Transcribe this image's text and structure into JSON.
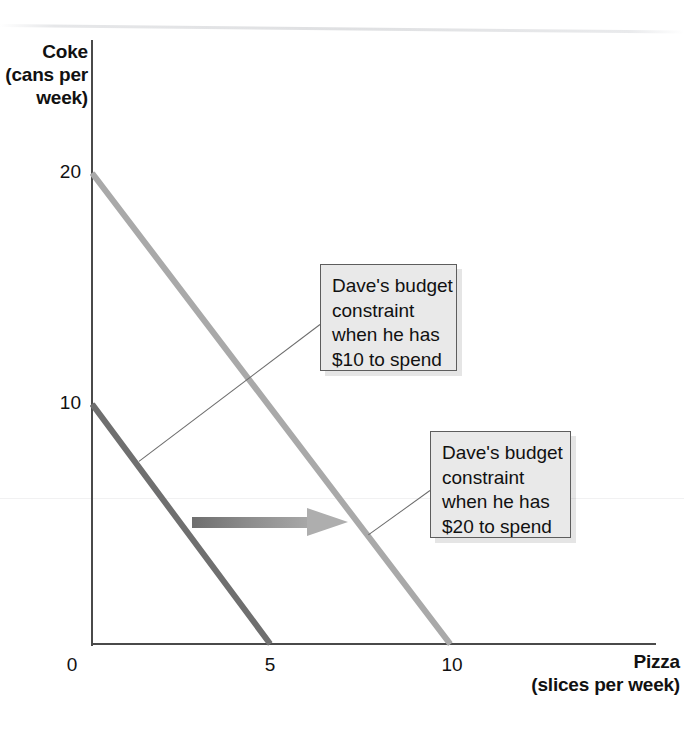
{
  "chart_data": {
    "type": "line",
    "title": "",
    "xlabel": "Pizza (slices per week)",
    "ylabel": "Coke (cans per week)",
    "xlabel_line1": "Pizza",
    "xlabel_line2": "(slices per week)",
    "ylabel_line1": "Coke",
    "ylabel_line2": "(cans",
    "ylabel_line3": "per",
    "ylabel_line4": "week)",
    "xlim": [
      0,
      14
    ],
    "ylim": [
      0,
      23
    ],
    "xticks": [
      "0",
      "5",
      "10"
    ],
    "xtick_values": [
      0,
      5,
      10
    ],
    "yticks": [
      "20",
      "10"
    ],
    "ytick_values": [
      20,
      10
    ],
    "grid": false,
    "legend": "none",
    "series": [
      {
        "name": "Dave's budget constraint when he has $10 to spend",
        "color": "#6f6f6f",
        "x": [
          0,
          5
        ],
        "y": [
          10,
          0
        ],
        "intercept_coke": 10,
        "intercept_pizza": 5
      },
      {
        "name": "Dave's budget constraint when he has $20 to spend",
        "color": "#a9a9a9",
        "x": [
          0,
          10
        ],
        "y": [
          20,
          0
        ],
        "intercept_coke": 20,
        "intercept_pizza": 10
      }
    ],
    "annotations": [
      {
        "id": "callout-10",
        "lines": [
          "Dave's budget",
          "constraint",
          "when he has",
          "$10 to spend"
        ],
        "points_to_series": "Dave's budget constraint when he has $10 to spend"
      },
      {
        "id": "callout-20",
        "lines": [
          "Dave's budget",
          "constraint",
          "when he has",
          "$20 to spend"
        ],
        "points_to_series": "Dave's budget constraint when he has $20 to spend"
      },
      {
        "id": "shift-arrow",
        "lines": [],
        "meaning": "outward shift of budget constraint"
      }
    ]
  },
  "colors": {
    "line_10": "#6f6f6f",
    "line_20": "#a9a9a9",
    "axis": "#4a4a4a",
    "callout_fill": "#e9e9e9",
    "callout_border": "#5d5d5d",
    "text": "#111111"
  }
}
